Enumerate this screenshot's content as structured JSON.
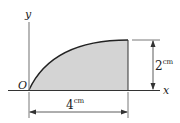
{
  "diagram": {
    "type": "area-under-curve",
    "axes": {
      "x_label": "x",
      "y_label": "y",
      "origin_label": "O"
    },
    "region": {
      "fill": "#d4d4d4",
      "stroke": "#222222"
    },
    "dimensions": {
      "height": {
        "value": "2",
        "unit": "cm"
      },
      "width": {
        "value": "4",
        "unit": "cm"
      }
    }
  }
}
